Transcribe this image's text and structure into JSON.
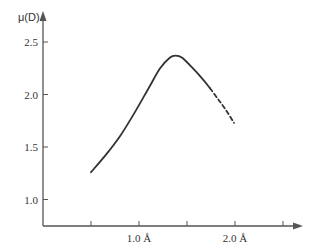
{
  "chart_data": {
    "type": "line",
    "title": "",
    "xlabel": "",
    "ylabel": "μ(D)",
    "xlim": [
      0,
      2.7
    ],
    "ylim": [
      0.75,
      2.7
    ],
    "grid": false,
    "legend": null,
    "x_ticks": [
      {
        "value": 0.5,
        "label": ""
      },
      {
        "value": 1.0,
        "label": "1.0 Å"
      },
      {
        "value": 1.5,
        "label": ""
      },
      {
        "value": 2.0,
        "label": "2.0 Å"
      },
      {
        "value": 2.5,
        "label": ""
      }
    ],
    "y_ticks": [
      {
        "value": 1.0,
        "label": "1.0"
      },
      {
        "value": 1.5,
        "label": "1.5"
      },
      {
        "value": 2.0,
        "label": "2.0"
      },
      {
        "value": 2.5,
        "label": "2.5"
      }
    ],
    "series": [
      {
        "name": "dipole moment (measured)",
        "style": "solid",
        "x": [
          0.5,
          0.65,
          0.8,
          0.95,
          1.1,
          1.22,
          1.32,
          1.38,
          1.45,
          1.55,
          1.65,
          1.74
        ],
        "y": [
          1.26,
          1.42,
          1.6,
          1.82,
          2.06,
          2.25,
          2.35,
          2.37,
          2.35,
          2.26,
          2.16,
          2.06
        ]
      },
      {
        "name": "dipole moment (extrapolated)",
        "style": "dashed",
        "x": [
          1.74,
          1.82,
          1.9,
          1.99
        ],
        "y": [
          2.06,
          1.96,
          1.86,
          1.73
        ]
      }
    ]
  },
  "axes": {
    "y_title": "μ(D)",
    "colors": {
      "axis": "#555555",
      "curve": "#333333"
    }
  }
}
